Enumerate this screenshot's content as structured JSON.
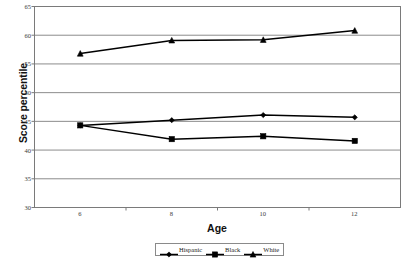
{
  "chart_data": {
    "type": "line",
    "title": "",
    "xlabel": "Age",
    "ylabel": "Score percentile",
    "categories": [
      "6",
      "8",
      "10",
      "12"
    ],
    "x": [
      6,
      8,
      10,
      12
    ],
    "ylim": [
      30,
      65
    ],
    "yticks": [
      30,
      35,
      40,
      45,
      50,
      55,
      60,
      65
    ],
    "ytick_labels": [
      "30",
      "35",
      "40",
      "45",
      "50",
      "55",
      "60",
      "65"
    ],
    "grid": "horizontal",
    "legend_position": "bottom",
    "series": [
      {
        "name": "Hispanic",
        "marker": "diamond",
        "color": "#000000",
        "values": [
          44.3,
          45.2,
          46.1,
          45.7
        ]
      },
      {
        "name": "Black",
        "marker": "square",
        "color": "#000000",
        "values": [
          44.3,
          41.9,
          42.4,
          41.6
        ]
      },
      {
        "name": "White",
        "marker": "triangle",
        "color": "#000000",
        "values": [
          56.8,
          59.1,
          59.2,
          60.8
        ]
      }
    ]
  },
  "axes": {
    "y_title": "Score percentile",
    "x_title": "Age"
  },
  "legend": {
    "items": [
      {
        "label": "Hispanic",
        "marker": "diamond"
      },
      {
        "label": "Black",
        "marker": "square"
      },
      {
        "label": "White",
        "marker": "triangle"
      }
    ]
  },
  "colors": {
    "series": "#000000",
    "gridline": "#8c8c8c",
    "plot_border": "#7a7a7a",
    "axis_text": "#3a3a3a",
    "title_text": "#111111",
    "background": "#ffffff"
  }
}
